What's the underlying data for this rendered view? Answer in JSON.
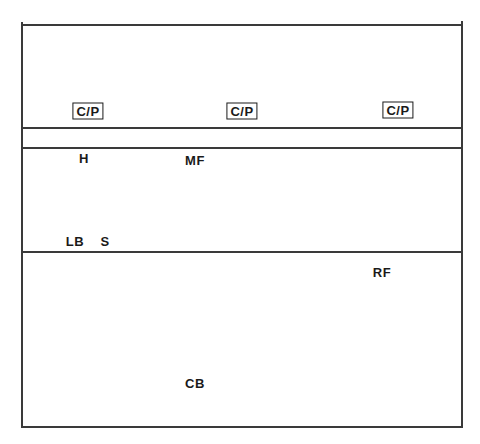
{
  "diagram": {
    "type": "field-position-diagram",
    "stroke_color": "#3a3a3a",
    "text_color": "#1a1a1a",
    "frame": {
      "left": 22,
      "right": 462,
      "top": 25,
      "bottom": 427
    },
    "horizontal_lines_y": [
      25,
      128,
      148,
      252,
      427
    ],
    "markers": [
      {
        "id": "cp-left",
        "label": "C/P",
        "boxed": true,
        "x": 88,
        "y": 111
      },
      {
        "id": "cp-center",
        "label": "C/P",
        "boxed": true,
        "x": 242,
        "y": 111
      },
      {
        "id": "cp-right",
        "label": "C/P",
        "boxed": true,
        "x": 398,
        "y": 110
      },
      {
        "id": "h",
        "label": "H",
        "boxed": false,
        "x": 84,
        "y": 158
      },
      {
        "id": "mf",
        "label": "MF",
        "boxed": false,
        "x": 195,
        "y": 160
      },
      {
        "id": "lb",
        "label": "LB",
        "boxed": false,
        "x": 75,
        "y": 241
      },
      {
        "id": "s",
        "label": "S",
        "boxed": false,
        "x": 105,
        "y": 241
      },
      {
        "id": "rf",
        "label": "RF",
        "boxed": false,
        "x": 382,
        "y": 272
      },
      {
        "id": "cb",
        "label": "CB",
        "boxed": false,
        "x": 195,
        "y": 383
      }
    ]
  }
}
